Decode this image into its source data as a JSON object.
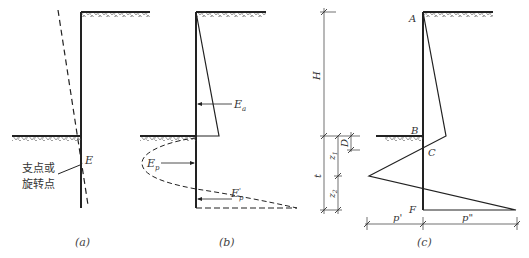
{
  "figure": {
    "panels": [
      {
        "id": "a",
        "caption": "(a)",
        "labels": {
          "point": "E",
          "annotation_line1": "支点或",
          "annotation_line2": "旋转点"
        }
      },
      {
        "id": "b",
        "caption": "(b)",
        "labels": {
          "active": "Ea",
          "active_main": "E",
          "active_sub": "a",
          "passive": "Ep",
          "passive_main": "E",
          "passive_sub": "p",
          "passive_back": "E'p",
          "passive_back_main": "E",
          "passive_back_sub": "p",
          "passive_back_sup": "'"
        }
      },
      {
        "id": "c",
        "caption": "(c)",
        "labels": {
          "A": "A",
          "B": "B",
          "C": "C",
          "F": "F",
          "H": "H",
          "t": "t",
          "D": "D",
          "z1_main": "z",
          "z1_sub": "1",
          "z2_main": "z",
          "z2_sub": "2",
          "p_prime": "p'",
          "p_double": "p\""
        }
      }
    ],
    "colors": {
      "line": "#222222",
      "text": "#333333",
      "background": "#ffffff"
    }
  }
}
